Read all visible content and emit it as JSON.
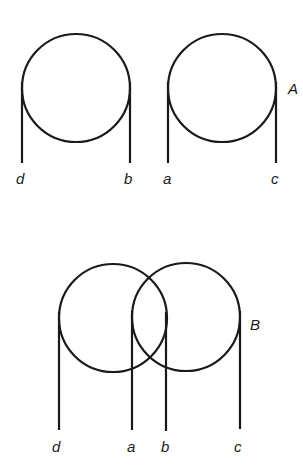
{
  "figure_A": {
    "label": "A",
    "pulleys": [
      {
        "cx": 76,
        "cy": 88,
        "r": 54,
        "left_label": "d",
        "right_label": "b"
      },
      {
        "cx": 222,
        "cy": 88,
        "r": 54,
        "left_label": "a",
        "right_label": "c"
      }
    ]
  },
  "figure_B": {
    "label": "B",
    "pulleys": [
      {
        "cx": 113,
        "cy": 318,
        "r": 54,
        "left_label": "d",
        "right_label": "b"
      },
      {
        "cx": 186,
        "cy": 317,
        "r": 54,
        "left_label": "a",
        "right_label": "c"
      }
    ]
  }
}
